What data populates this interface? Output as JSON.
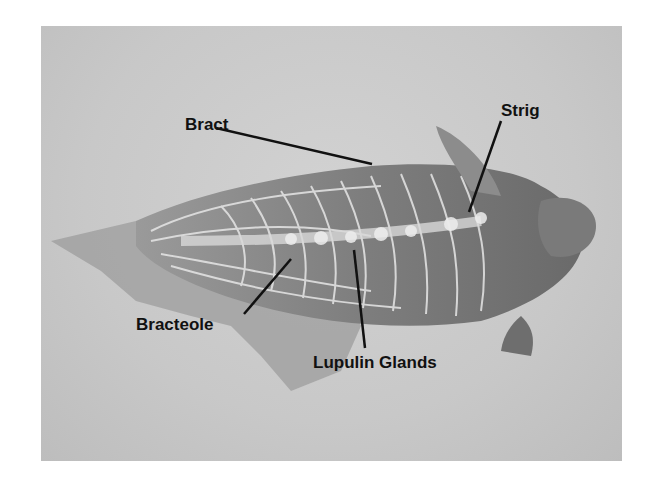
{
  "figure": {
    "labels": [
      {
        "id": "bract",
        "text": "Bract"
      },
      {
        "id": "strig",
        "text": "Strig"
      },
      {
        "id": "bracteole",
        "text": "Bracteole"
      },
      {
        "id": "lupulin",
        "text": "Lupulin Glands"
      }
    ]
  }
}
